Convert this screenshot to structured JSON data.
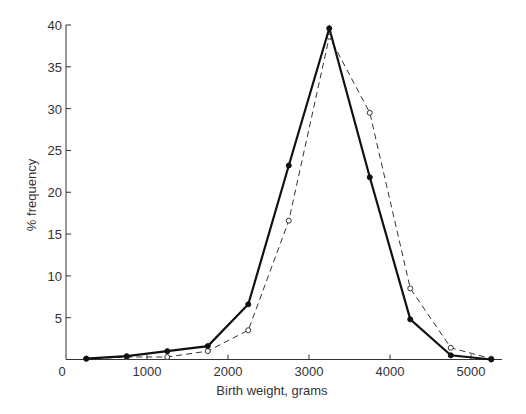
{
  "chart_data": {
    "type": "line",
    "title": "",
    "xlabel": "Birth weight, grams",
    "ylabel": "% frequency",
    "xlim": [
      0,
      5500
    ],
    "ylim": [
      0,
      40
    ],
    "x_ticks": [
      0,
      1000,
      2000,
      3000,
      4000,
      5000
    ],
    "x_tick_labels": [
      "0",
      "1000",
      "2000",
      "3000",
      "4000",
      "5000"
    ],
    "y_ticks": [
      5,
      10,
      15,
      20,
      25,
      30,
      35,
      40
    ],
    "y_tick_labels": [
      "5",
      "10",
      "15",
      "20",
      "25",
      "30",
      "35",
      "40"
    ],
    "grid": false,
    "legend": null,
    "x": [
      250,
      750,
      1250,
      1750,
      2250,
      2750,
      3250,
      3750,
      4250,
      4750,
      5250
    ],
    "series": [
      {
        "name": "solid line, filled markers",
        "style": "solid",
        "marker": "filled-circle",
        "color": "#111111",
        "values": [
          0.1,
          0.4,
          1.0,
          1.6,
          6.6,
          23.2,
          39.6,
          21.8,
          4.8,
          0.5,
          0.0
        ]
      },
      {
        "name": "dashed line, open markers",
        "style": "dashed",
        "marker": "open-circle",
        "color": "#333333",
        "values": [
          0.1,
          0.3,
          0.3,
          1.0,
          3.5,
          16.6,
          38.6,
          29.5,
          8.5,
          1.4,
          0.1
        ]
      }
    ]
  }
}
